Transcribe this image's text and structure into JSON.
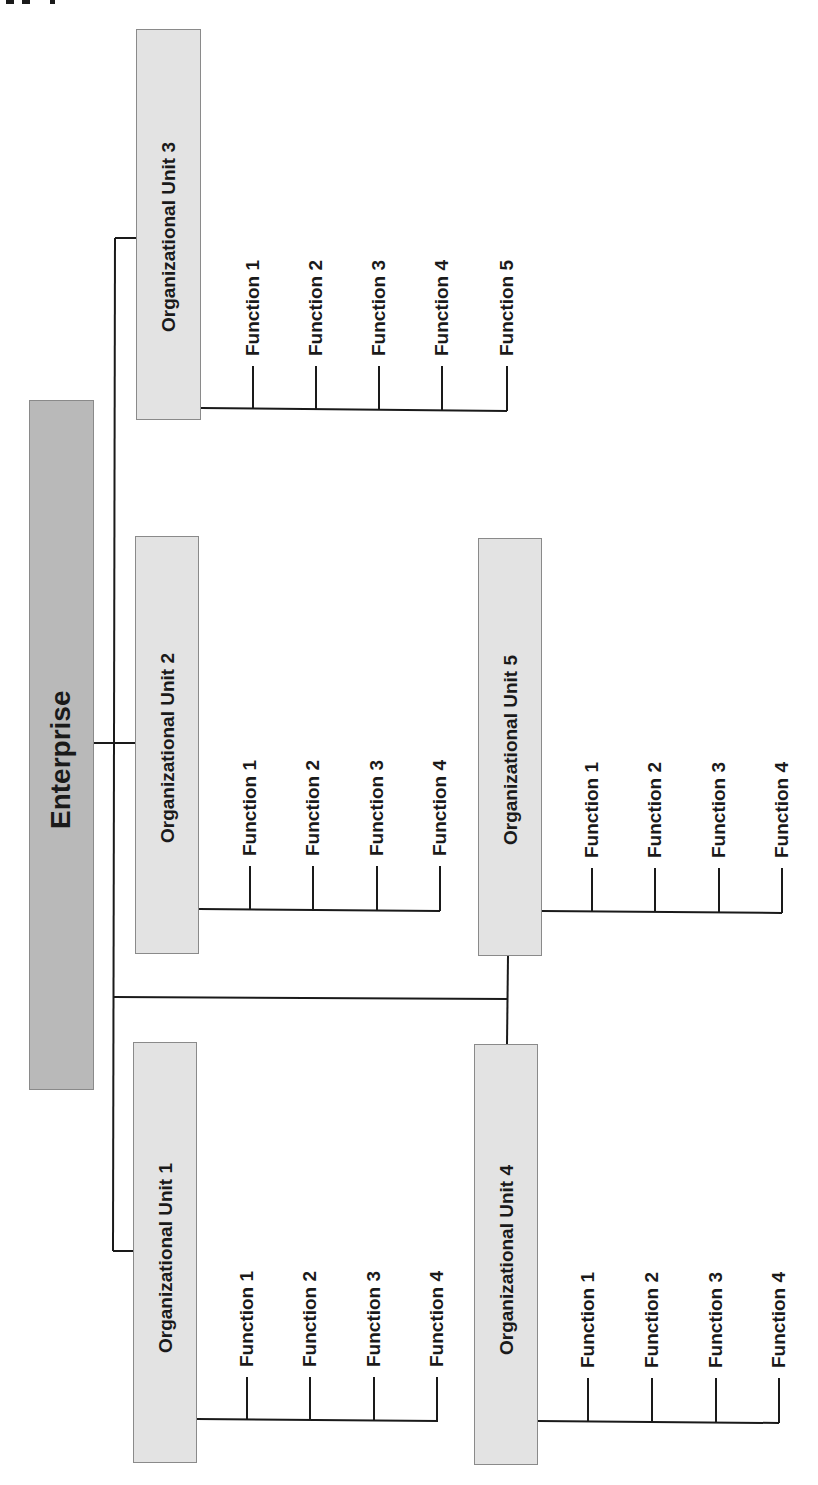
{
  "diagram": {
    "type": "org-chart",
    "orientation": "rotated-90-ccw",
    "colors": {
      "enterprise_fill": "#b9b9b9",
      "unit_fill": "#e3e3e3",
      "line": "#1a1a1a",
      "border": "#8a8a8a"
    },
    "root": {
      "label": "Enterprise"
    },
    "units": [
      {
        "label": "Organizational Unit 1",
        "functions": [
          "Function 1",
          "Function 2",
          "Function 3",
          "Function 4"
        ]
      },
      {
        "label": "Organizational Unit 2",
        "functions": [
          "Function 1",
          "Function 2",
          "Function 3",
          "Function 4"
        ]
      },
      {
        "label": "Organizational Unit 3",
        "functions": [
          "Function 1",
          "Function 2",
          "Function 3",
          "Function 4",
          "Function 5"
        ]
      },
      {
        "label": "Organizational Unit 4",
        "functions": [
          "Function 1",
          "Function 2",
          "Function 3",
          "Function 4"
        ]
      },
      {
        "label": "Organizational Unit 5",
        "functions": [
          "Function 1",
          "Function 2",
          "Function 3",
          "Function 4"
        ]
      }
    ]
  }
}
